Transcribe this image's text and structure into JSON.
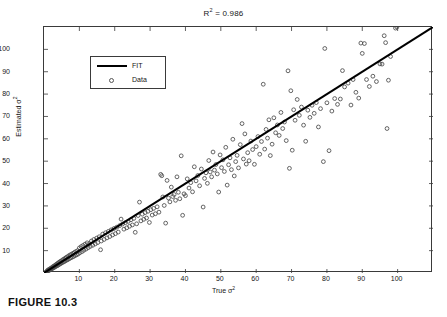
{
  "figure": {
    "caption": "FIGURE 10.3"
  },
  "chart_data": {
    "type": "scatter",
    "title_base": "R",
    "title_sup": "2",
    "title_rest": " = 0.986",
    "r_squared": 0.986,
    "xlabel_base": "True σ",
    "xlabel_sup": "2",
    "xlabel": "True σ²",
    "ylabel_base": "Estimated σ",
    "ylabel_sup": "2",
    "ylabel": "Estimated σ²",
    "xlim": [
      0,
      110
    ],
    "ylim": [
      0,
      110
    ],
    "xticks": [
      10,
      20,
      30,
      40,
      50,
      60,
      70,
      80,
      90,
      100
    ],
    "yticks": [
      10,
      20,
      30,
      40,
      50,
      60,
      70,
      80,
      90,
      100
    ],
    "grid": false,
    "legend_position": "upper-left",
    "legend": [
      {
        "label": "FIT",
        "marker": "line",
        "color": "#000000"
      },
      {
        "label": "Data",
        "marker": "circle",
        "color": "#555555"
      }
    ],
    "fit_line": {
      "name": "FIT",
      "slope": 1.0,
      "intercept": 0.0,
      "x": [
        0,
        110
      ],
      "y": [
        0,
        110
      ]
    },
    "marker_style": "open-circle",
    "marker_color": "#4a4a4a",
    "series": [
      {
        "name": "Data",
        "points": [
          [
            0.5,
            0.4
          ],
          [
            0.8,
            0.7
          ],
          [
            1.0,
            1.2
          ],
          [
            1.1,
            0.9
          ],
          [
            1.3,
            1.5
          ],
          [
            1.4,
            1.1
          ],
          [
            1.6,
            1.8
          ],
          [
            1.7,
            1.4
          ],
          [
            1.9,
            2.1
          ],
          [
            2.0,
            1.6
          ],
          [
            2.2,
            2.4
          ],
          [
            2.3,
            2.0
          ],
          [
            2.5,
            2.8
          ],
          [
            2.6,
            2.2
          ],
          [
            2.8,
            3.1
          ],
          [
            2.9,
            2.5
          ],
          [
            3.1,
            3.4
          ],
          [
            3.2,
            2.8
          ],
          [
            3.4,
            3.8
          ],
          [
            3.5,
            3.1
          ],
          [
            3.7,
            4.1
          ],
          [
            3.8,
            3.3
          ],
          [
            4.0,
            4.5
          ],
          [
            4.1,
            3.6
          ],
          [
            4.3,
            4.8
          ],
          [
            4.5,
            4.0
          ],
          [
            4.6,
            5.2
          ],
          [
            4.8,
            4.3
          ],
          [
            5.0,
            5.5
          ],
          [
            5.1,
            4.6
          ],
          [
            5.3,
            5.9
          ],
          [
            5.5,
            4.9
          ],
          [
            5.6,
            6.2
          ],
          [
            5.8,
            5.2
          ],
          [
            6.0,
            6.6
          ],
          [
            6.1,
            5.5
          ],
          [
            6.3,
            7.0
          ],
          [
            6.5,
            5.8
          ],
          [
            6.7,
            7.3
          ],
          [
            6.8,
            6.1
          ],
          [
            7.0,
            7.7
          ],
          [
            7.2,
            6.4
          ],
          [
            7.4,
            8.1
          ],
          [
            7.6,
            6.8
          ],
          [
            7.8,
            8.4
          ],
          [
            8.0,
            7.1
          ],
          [
            8.2,
            8.8
          ],
          [
            8.4,
            7.4
          ],
          [
            8.6,
            9.2
          ],
          [
            8.8,
            7.8
          ],
          [
            9.0,
            9.6
          ],
          [
            9.2,
            8.1
          ],
          [
            9.5,
            10.0
          ],
          [
            9.7,
            8.5
          ],
          [
            10.0,
            11.2
          ],
          [
            10.2,
            9.1
          ],
          [
            10.5,
            11.8
          ],
          [
            10.8,
            9.6
          ],
          [
            11.0,
            12.3
          ],
          [
            11.3,
            10.2
          ],
          [
            11.6,
            12.9
          ],
          [
            11.9,
            10.7
          ],
          [
            12.2,
            13.5
          ],
          [
            12.5,
            11.3
          ],
          [
            12.8,
            13.1
          ],
          [
            13.1,
            11.9
          ],
          [
            13.4,
            14.3
          ],
          [
            13.8,
            12.4
          ],
          [
            14.1,
            15.0
          ],
          [
            14.5,
            13.0
          ],
          [
            14.9,
            15.6
          ],
          [
            15.2,
            13.6
          ],
          [
            15.6,
            16.2
          ],
          [
            16.0,
            10.4
          ],
          [
            16.2,
            14.3
          ],
          [
            16.6,
            17.4
          ],
          [
            17.0,
            15.0
          ],
          [
            17.4,
            18.0
          ],
          [
            17.8,
            15.7
          ],
          [
            18.2,
            18.6
          ],
          [
            18.6,
            16.3
          ],
          [
            19.0,
            19.3
          ],
          [
            19.4,
            17.0
          ],
          [
            19.8,
            19.9
          ],
          [
            20.2,
            17.6
          ],
          [
            20.6,
            20.5
          ],
          [
            21.0,
            18.3
          ],
          [
            21.4,
            21.2
          ],
          [
            21.8,
            24.1
          ],
          [
            22.2,
            21.9
          ],
          [
            22.6,
            19.6
          ],
          [
            23.0,
            22.5
          ],
          [
            23.4,
            20.2
          ],
          [
            23.8,
            23.1
          ],
          [
            24.2,
            20.9
          ],
          [
            24.6,
            23.8
          ],
          [
            25.0,
            21.5
          ],
          [
            25.4,
            24.4
          ],
          [
            25.8,
            18.2
          ],
          [
            26.2,
            22.0
          ],
          [
            26.6,
            25.7
          ],
          [
            27.0,
            31.7
          ],
          [
            27.4,
            23.3
          ],
          [
            27.8,
            26.3
          ],
          [
            28.2,
            24.0
          ],
          [
            28.6,
            27.0
          ],
          [
            29.0,
            24.6
          ],
          [
            29.4,
            27.6
          ],
          [
            29.8,
            22.6
          ],
          [
            30.2,
            28.3
          ],
          [
            30.6,
            25.9
          ],
          [
            31.0,
            28.9
          ],
          [
            31.5,
            26.5
          ],
          [
            32.0,
            29.6
          ],
          [
            32.5,
            27.2
          ],
          [
            33.0,
            44.1
          ],
          [
            33.3,
            43.5
          ],
          [
            33.6,
            34.0
          ],
          [
            34.0,
            30.2
          ],
          [
            34.4,
            22.3
          ],
          [
            34.8,
            41.4
          ],
          [
            35.2,
            33.5
          ],
          [
            35.6,
            31.8
          ],
          [
            36.0,
            38.4
          ],
          [
            36.4,
            34.2
          ],
          [
            36.8,
            35.1
          ],
          [
            37.2,
            32.5
          ],
          [
            37.6,
            43.0
          ],
          [
            38.0,
            36.1
          ],
          [
            38.4,
            33.2
          ],
          [
            38.8,
            52.4
          ],
          [
            39.2,
            25.8
          ],
          [
            39.6,
            35.4
          ],
          [
            40.0,
            34.6
          ],
          [
            40.5,
            42.1
          ],
          [
            41.0,
            38.0
          ],
          [
            41.5,
            40.4
          ],
          [
            42.0,
            36.3
          ],
          [
            42.5,
            47.5
          ],
          [
            43.0,
            41.2
          ],
          [
            43.5,
            43.6
          ],
          [
            44.0,
            39.0
          ],
          [
            44.5,
            46.5
          ],
          [
            45.0,
            29.5
          ],
          [
            45.4,
            42.3
          ],
          [
            45.8,
            44.8
          ],
          [
            46.2,
            40.1
          ],
          [
            46.6,
            50.3
          ],
          [
            47.0,
            45.2
          ],
          [
            47.4,
            43.0
          ],
          [
            47.8,
            54.1
          ],
          [
            48.2,
            46.0
          ],
          [
            48.6,
            48.5
          ],
          [
            49.0,
            44.3
          ],
          [
            49.4,
            36.2
          ],
          [
            49.8,
            52.8
          ],
          [
            50.2,
            47.1
          ],
          [
            50.6,
            50.6
          ],
          [
            51.0,
            45.4
          ],
          [
            51.4,
            56.2
          ],
          [
            51.8,
            39.3
          ],
          [
            52.2,
            48.4
          ],
          [
            52.6,
            51.5
          ],
          [
            53.0,
            46.2
          ],
          [
            53.4,
            59.8
          ],
          [
            53.8,
            43.4
          ],
          [
            54.2,
            49.8
          ],
          [
            54.6,
            52.6
          ],
          [
            55.0,
            47.0
          ],
          [
            55.5,
            57.4
          ],
          [
            56.0,
            66.8
          ],
          [
            56.4,
            51.0
          ],
          [
            56.8,
            62.2
          ],
          [
            57.2,
            48.7
          ],
          [
            57.6,
            53.8
          ],
          [
            58.0,
            50.2
          ],
          [
            58.5,
            59.0
          ],
          [
            59.0,
            55.2
          ],
          [
            59.5,
            48.6
          ],
          [
            60.0,
            56.5
          ],
          [
            60.5,
            61.0
          ],
          [
            61.0,
            53.1
          ],
          [
            61.5,
            58.8
          ],
          [
            62.0,
            84.4
          ],
          [
            62.4,
            55.4
          ],
          [
            62.8,
            64.2
          ],
          [
            63.2,
            60.3
          ],
          [
            63.6,
            68.5
          ],
          [
            64.0,
            52.5
          ],
          [
            64.5,
            57.6
          ],
          [
            65.0,
            69.4
          ],
          [
            65.5,
            62.7
          ],
          [
            66.0,
            66.2
          ],
          [
            66.5,
            61.5
          ],
          [
            67.0,
            71.8
          ],
          [
            67.5,
            64.6
          ],
          [
            68.0,
            67.5
          ],
          [
            68.5,
            59.2
          ],
          [
            69.0,
            90.4
          ],
          [
            69.4,
            46.8
          ],
          [
            69.8,
            81.5
          ],
          [
            70.2,
            54.9
          ],
          [
            70.6,
            73.0
          ],
          [
            71.0,
            68.3
          ],
          [
            71.6,
            77.6
          ],
          [
            72.2,
            70.5
          ],
          [
            72.8,
            74.2
          ],
          [
            73.4,
            66.1
          ],
          [
            74.0,
            58.9
          ],
          [
            74.6,
            72.8
          ],
          [
            75.2,
            69.6
          ],
          [
            75.8,
            75.0
          ],
          [
            76.4,
            71.4
          ],
          [
            77.0,
            76.2
          ],
          [
            77.6,
            65.3
          ],
          [
            78.2,
            73.5
          ],
          [
            79.0,
            49.8
          ],
          [
            79.4,
            100.4
          ],
          [
            80.0,
            76.1
          ],
          [
            80.6,
            54.7
          ],
          [
            81.4,
            72.4
          ],
          [
            82.2,
            78.0
          ],
          [
            83.0,
            75.4
          ],
          [
            83.8,
            77.8
          ],
          [
            84.4,
            90.5
          ],
          [
            85.0,
            83.2
          ],
          [
            86.0,
            84.9
          ],
          [
            86.8,
            75.1
          ],
          [
            87.4,
            86.5
          ],
          [
            88.2,
            80.8
          ],
          [
            89.0,
            78.2
          ],
          [
            89.6,
            102.8
          ],
          [
            90.0,
            98.2
          ],
          [
            90.6,
            102.6
          ],
          [
            91.2,
            86.5
          ],
          [
            92.0,
            83.4
          ],
          [
            93.0,
            88.0
          ],
          [
            94.0,
            85.6
          ],
          [
            95.0,
            93.5
          ],
          [
            95.6,
            93.4
          ],
          [
            96.2,
            106.1
          ],
          [
            96.6,
            103.0
          ],
          [
            97.0,
            64.6
          ],
          [
            97.4,
            86.2
          ],
          [
            98.0,
            96.8
          ],
          [
            99.4,
            109.5
          ],
          [
            99.8,
            110.0
          ]
        ]
      }
    ]
  }
}
